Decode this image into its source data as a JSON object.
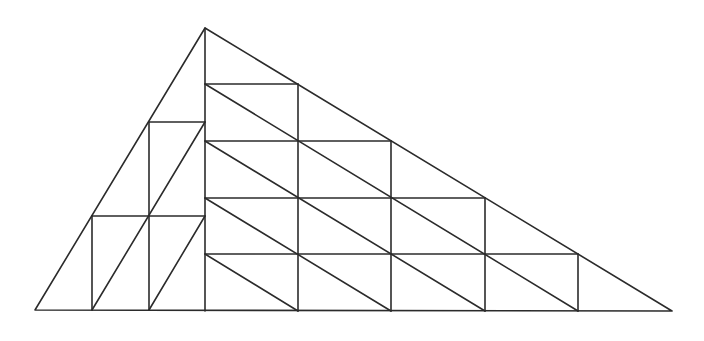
{
  "diagram": {
    "type": "geometric-figure",
    "stroke_color": "#2b2b2b",
    "background": "#ffffff",
    "outer_triangle": {
      "vertices": [
        [
          35,
          310
        ],
        [
          205,
          28
        ],
        [
          672,
          311
        ]
      ]
    },
    "left_region": {
      "columns": 3,
      "rows": 3,
      "x_lines": [
        35,
        92,
        149,
        205
      ],
      "y_lines": [
        28,
        122,
        216,
        310
      ],
      "verticals": [
        {
          "x": 92,
          "y1": 216,
          "y2": 310
        },
        {
          "x": 149,
          "y1": 122,
          "y2": 310
        }
      ],
      "horizontals": [
        {
          "y": 216,
          "x1": 92,
          "x2": 205
        },
        {
          "y": 122,
          "x1": 149,
          "x2": 205
        }
      ],
      "diagonals": [
        {
          "x1": 92,
          "y1": 310,
          "x2": 205,
          "y2": 122
        },
        {
          "x1": 149,
          "y1": 310,
          "x2": 205,
          "y2": 216
        }
      ]
    },
    "right_region": {
      "columns": 5,
      "rows": 5,
      "x_lines": [
        205,
        298,
        391,
        485,
        578,
        672
      ],
      "y_lines": [
        28,
        84,
        141,
        198,
        254,
        311
      ],
      "verticals": [
        {
          "x": 205,
          "y1": 28,
          "y2": 311
        },
        {
          "x": 298,
          "y1": 84,
          "y2": 311
        },
        {
          "x": 391,
          "y1": 141,
          "y2": 311
        },
        {
          "x": 485,
          "y1": 198,
          "y2": 311
        },
        {
          "x": 578,
          "y1": 254,
          "y2": 311
        }
      ],
      "horizontals": [
        {
          "y": 84,
          "x1": 205,
          "x2": 298
        },
        {
          "y": 141,
          "x1": 205,
          "x2": 391
        },
        {
          "y": 198,
          "x1": 205,
          "x2": 485
        },
        {
          "y": 254,
          "x1": 205,
          "x2": 578
        }
      ],
      "diagonals": [
        {
          "x1": 205,
          "y1": 84,
          "x2": 578,
          "y2": 311
        },
        {
          "x1": 205,
          "y1": 141,
          "x2": 485,
          "y2": 311
        },
        {
          "x1": 205,
          "y1": 198,
          "x2": 391,
          "y2": 311
        },
        {
          "x1": 205,
          "y1": 254,
          "x2": 298,
          "y2": 311
        }
      ]
    },
    "base": {
      "x1": 35,
      "y1": 310,
      "x2": 672,
      "y2": 311
    }
  }
}
